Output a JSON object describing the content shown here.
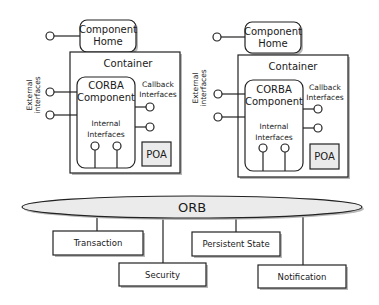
{
  "diagram": {
    "containers": [
      {
        "component_home": {
          "line1": "Component",
          "line2": "Home"
        },
        "container_label": "Container",
        "external_label": {
          "line1": "External",
          "line2": "interfaces"
        },
        "component": {
          "line1": "CORBA",
          "line2": "Component"
        },
        "callback_label": {
          "line1": "Callback",
          "line2": "Interfaces"
        },
        "internal_label": {
          "line1": "Internal",
          "line2": "Interfaces"
        },
        "poa_label": "POA"
      },
      {
        "component_home": {
          "line1": "Component",
          "line2": "Home"
        },
        "container_label": "Container",
        "external_label": {
          "line1": "External",
          "line2": "interfaces"
        },
        "component": {
          "line1": "CORBA",
          "line2": "Component"
        },
        "callback_label": {
          "line1": "Callback",
          "line2": "Interfaces"
        },
        "internal_label": {
          "line1": "Internal",
          "line2": "Interfaces"
        },
        "poa_label": "POA"
      }
    ],
    "orb_label": "ORB",
    "services": [
      "Transaction",
      "Security",
      "Persistent State",
      "Notification"
    ],
    "colors": {
      "stroke": "#222222",
      "fill_grey": "#ebebeb",
      "shadow": "#b8b8b8",
      "background": "#ffffff"
    }
  }
}
